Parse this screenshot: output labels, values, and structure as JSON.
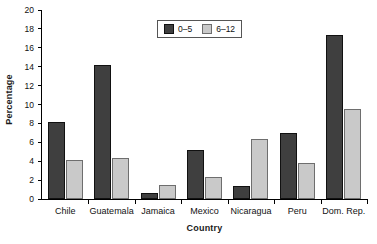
{
  "chart_data": {
    "type": "bar",
    "title": "",
    "subtitle": "",
    "xlabel": "Country",
    "ylabel": "Percentage",
    "categories": [
      "Chile",
      "Guatemala",
      "Jamaica",
      "Mexico",
      "Nicaragua",
      "Peru",
      "Dom. Rep."
    ],
    "series": [
      {
        "name": "0–5",
        "color": "#3f3f3f",
        "values": [
          8.2,
          14.2,
          0.6,
          5.2,
          1.4,
          7.0,
          17.4
        ]
      },
      {
        "name": "6–12",
        "color": "#c9c9c9",
        "values": [
          4.1,
          4.3,
          1.5,
          2.3,
          6.4,
          3.8,
          9.5
        ]
      }
    ],
    "ylim": [
      0,
      20
    ],
    "yticks": [
      0,
      2,
      4,
      6,
      8,
      10,
      12,
      14,
      16,
      18,
      20
    ],
    "ytick_labels": [
      "0",
      "2",
      "4",
      "6",
      "8",
      "10",
      "12",
      "14",
      "16",
      "18",
      "20"
    ],
    "grid": false,
    "legend_position": "top-center",
    "legend_entries": [
      "0–5",
      "6–12"
    ]
  }
}
